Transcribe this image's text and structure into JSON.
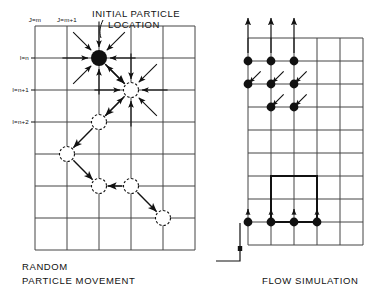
{
  "figure": {
    "width": 377,
    "height": 300,
    "background": "#ffffff",
    "ink": "#111111",
    "grid_color": "#444444"
  },
  "left_panel": {
    "name": "random-particle-movement-diagram",
    "caption_line1": "RANDOM",
    "caption_line2": "PARTICLE MOVEMENT",
    "annotation_line1": "INITIAL PARTICLE",
    "annotation_line2": "LOCATION",
    "column_labels": [
      {
        "text": "J=m",
        "col": 0
      },
      {
        "text": "J=m+1",
        "col": 1
      }
    ],
    "row_labels": [
      {
        "text": "I=n",
        "row": 0
      },
      {
        "text": "I=n+1",
        "row": 1
      },
      {
        "text": "I=n+2",
        "row": 2
      }
    ],
    "grid": {
      "origin_x": 35,
      "origin_y": 58,
      "step_x": 32,
      "step_y": 32,
      "cols": 6,
      "rows": 7
    },
    "initial_particle": {
      "col": 2,
      "row": 0,
      "filled": true,
      "radius": 8
    },
    "path_nodes": [
      {
        "col": 2,
        "row": 0,
        "filled": true
      },
      {
        "col": 3,
        "row": 1,
        "filled": false
      },
      {
        "col": 2,
        "row": 2,
        "filled": false
      },
      {
        "col": 1,
        "row": 3,
        "filled": false
      },
      {
        "col": 2,
        "row": 4,
        "filled": false
      },
      {
        "col": 3,
        "row": 4,
        "filled": false
      },
      {
        "col": 4,
        "row": 5,
        "filled": false
      }
    ],
    "star_nodes": [
      {
        "col": 2,
        "row": 0
      },
      {
        "col": 3,
        "row": 1
      }
    ],
    "path_steps": [
      {
        "from": [
          2,
          0
        ],
        "to": [
          3,
          1
        ]
      },
      {
        "from": [
          3,
          1
        ],
        "to": [
          2,
          2
        ]
      },
      {
        "from": [
          2,
          2
        ],
        "to": [
          1,
          3
        ]
      },
      {
        "from": [
          1,
          3
        ],
        "to": [
          2,
          4
        ]
      },
      {
        "from": [
          3,
          4
        ],
        "to": [
          2,
          4
        ]
      },
      {
        "from": [
          3,
          4
        ],
        "to": [
          4,
          5
        ]
      }
    ],
    "directions_label": "eight-direction random walk"
  },
  "right_panel": {
    "name": "flow-simulation-diagram",
    "caption": "FLOW SIMULATION",
    "grid": {
      "origin_x": 248,
      "origin_y": 38,
      "step_x": 23,
      "step_y": 23,
      "cols": 5,
      "rows": 9
    },
    "inflow_arrows": [
      {
        "col": 0
      },
      {
        "col": 1
      },
      {
        "col": 2
      }
    ],
    "particles_top": [
      {
        "col": 0,
        "row": 1
      },
      {
        "col": 1,
        "row": 1
      },
      {
        "col": 2,
        "row": 1
      },
      {
        "col": 0,
        "row": 2
      },
      {
        "col": 1,
        "row": 2
      },
      {
        "col": 2,
        "row": 2
      },
      {
        "col": 1,
        "row": 3
      },
      {
        "col": 2,
        "row": 3
      }
    ],
    "flow_vectors": [
      {
        "from": [
          0.55,
          1.45
        ],
        "to": [
          0.05,
          1.95
        ]
      },
      {
        "from": [
          1.55,
          1.45
        ],
        "to": [
          1.05,
          1.95
        ]
      },
      {
        "from": [
          2.55,
          1.45
        ],
        "to": [
          2.05,
          1.95
        ]
      },
      {
        "from": [
          1.55,
          2.45
        ],
        "to": [
          1.05,
          2.95
        ]
      },
      {
        "from": [
          2.55,
          2.45
        ],
        "to": [
          2.05,
          2.95
        ]
      }
    ],
    "obstacle": {
      "col": 1,
      "row": 6,
      "width_cells": 2,
      "height_cells": 2
    },
    "particles_bottom": [
      {
        "col": 0,
        "row": 8
      },
      {
        "col": 1,
        "row": 8
      },
      {
        "col": 2,
        "row": 8
      },
      {
        "col": 3,
        "row": 8
      }
    ],
    "outflow_ticks": [
      {
        "col": 0
      },
      {
        "col": 1
      },
      {
        "col": 2
      },
      {
        "col": 3
      }
    ],
    "corner_bracket": true
  }
}
